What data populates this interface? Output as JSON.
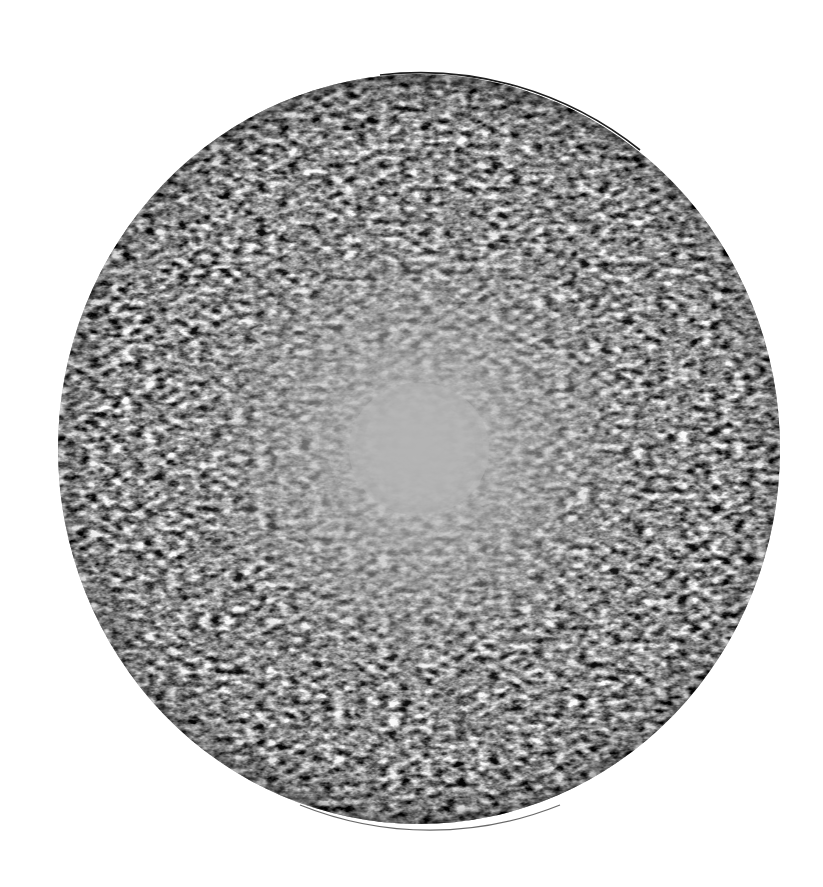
{
  "image": {
    "subject": "textured sphere",
    "description": "Grayscale sphere covered in concentric speckled/wavy texture, dark and coarse at the rim, fading to a smooth mid-gray patch at the center",
    "background_color": "#ffffff",
    "sphere": {
      "center_x": 419,
      "center_y": 449,
      "radius_x": 361,
      "radius_y": 375,
      "rim_color": "#2a2a2a",
      "center_color": "#b4b4b4",
      "texture_dark": "#3a3a3a",
      "texture_light": "#f0f0f0"
    }
  }
}
